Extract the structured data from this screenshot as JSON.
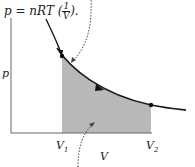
{
  "formula": {
    "prefix": "p = nRT (",
    "frac_num": "1",
    "frac_den": "V",
    "suffix": ")."
  },
  "axes": {
    "y_label": "p",
    "x_label": "V",
    "v1_main": "V",
    "v1_sub": "1",
    "v2_main": "V",
    "v2_sub": "2"
  },
  "colors": {
    "curve": "#1a1a1a",
    "shade": "#b8b8b8",
    "axis": "#666666",
    "dotted": "#444444"
  }
}
